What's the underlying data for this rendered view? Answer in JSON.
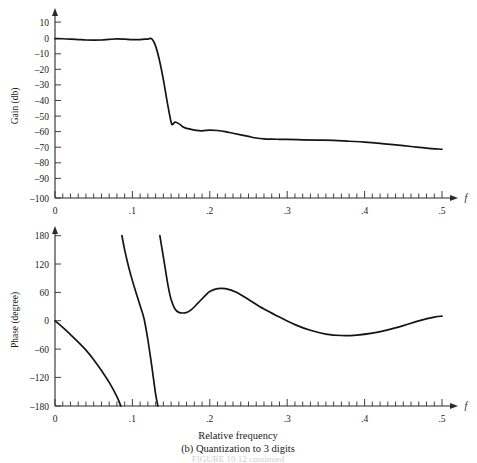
{
  "figure": {
    "caption_line1": "Relative frequency",
    "caption_line2": "(b) Quantization to 3 digits",
    "caption_faint": "FIGURE 10.12   continued"
  },
  "chart_data": [
    {
      "type": "line",
      "title": "",
      "panel": "gain",
      "xlabel": "f",
      "ylabel": "Gain (db)",
      "xlim": [
        0,
        0.5
      ],
      "ylim": [
        -100,
        10
      ],
      "yticks": [
        10,
        0,
        -10,
        -20,
        -30,
        -40,
        -50,
        -60,
        -70,
        -80,
        -90,
        -100
      ],
      "ytick_labels": [
        "10",
        "0",
        "–10",
        "–20",
        "–30",
        "–40",
        "–50",
        "–60",
        "–70",
        "–80",
        "–90",
        "–100"
      ],
      "xticks": [
        0,
        0.1,
        0.2,
        0.3,
        0.4,
        0.5
      ],
      "xtick_labels": [
        "0",
        ".1",
        ".2",
        ".3",
        ".4",
        ".5"
      ],
      "minor_tick_step": 0.01,
      "grid": false,
      "legend": "none",
      "x": [
        0.0,
        0.01,
        0.02,
        0.03,
        0.04,
        0.05,
        0.06,
        0.07,
        0.08,
        0.09,
        0.1,
        0.11,
        0.12,
        0.125,
        0.13,
        0.135,
        0.14,
        0.145,
        0.15,
        0.152,
        0.155,
        0.16,
        0.165,
        0.17,
        0.18,
        0.19,
        0.2,
        0.21,
        0.22,
        0.23,
        0.24,
        0.25,
        0.26,
        0.27,
        0.28,
        0.29,
        0.3,
        0.32,
        0.34,
        0.36,
        0.38,
        0.4,
        0.42,
        0.44,
        0.46,
        0.48,
        0.5
      ],
      "y": [
        -0.3,
        -0.4,
        -0.6,
        -0.9,
        -1.2,
        -1.3,
        -1.2,
        -0.8,
        -0.5,
        -0.7,
        -1.0,
        -0.9,
        -0.6,
        -0.5,
        -5.0,
        -14.0,
        -26.0,
        -40.0,
        -52.5,
        -54.0,
        -52.5,
        -53.5,
        -55.5,
        -56.5,
        -57.5,
        -58.0,
        -57.5,
        -57.8,
        -58.5,
        -59.5,
        -60.5,
        -61.5,
        -62.5,
        -63.0,
        -63.2,
        -63.3,
        -63.4,
        -63.6,
        -63.8,
        -64.0,
        -64.5,
        -65.0,
        -65.8,
        -66.8,
        -67.8,
        -68.8,
        -69.5
      ]
    },
    {
      "type": "line",
      "title": "",
      "panel": "phase",
      "xlabel": "f",
      "ylabel": "Phase (degree)",
      "xlim": [
        0,
        0.5
      ],
      "ylim": [
        -180,
        180
      ],
      "yticks": [
        180,
        120,
        60,
        0,
        -60,
        -120,
        -180
      ],
      "ytick_labels": [
        "180",
        "120",
        "60",
        "0",
        "–60",
        "–120",
        "–180"
      ],
      "xticks": [
        0,
        0.1,
        0.2,
        0.3,
        0.4,
        0.5
      ],
      "xtick_labels": [
        "0",
        ".1",
        ".2",
        ".3",
        ".4",
        ".5"
      ],
      "minor_tick_step": 0.01,
      "grid": false,
      "legend": "none",
      "branches": [
        {
          "name": "branch-1",
          "x": [
            0.0,
            0.01,
            0.02,
            0.03,
            0.04,
            0.05,
            0.06,
            0.07,
            0.08,
            0.085
          ],
          "y": [
            0,
            -14,
            -29,
            -45,
            -62,
            -82,
            -105,
            -130,
            -160,
            -180
          ]
        },
        {
          "name": "branch-2",
          "x": [
            0.0865,
            0.09,
            0.095,
            0.1,
            0.105,
            0.11,
            0.115,
            0.12,
            0.125,
            0.13,
            0.133
          ],
          "y": [
            180,
            150,
            115,
            85,
            58,
            32,
            5,
            -40,
            -95,
            -155,
            -180
          ]
        },
        {
          "name": "branch-3",
          "x": [
            0.1355,
            0.138,
            0.142,
            0.146,
            0.15,
            0.155,
            0.16,
            0.168,
            0.175,
            0.185,
            0.195,
            0.2,
            0.21,
            0.22,
            0.235,
            0.25,
            0.27,
            0.29,
            0.31,
            0.33,
            0.35,
            0.37,
            0.39,
            0.41,
            0.43,
            0.45,
            0.47,
            0.49,
            0.5
          ],
          "y": [
            180,
            155,
            115,
            75,
            45,
            25,
            18,
            17,
            22,
            38,
            55,
            62,
            68,
            68,
            60,
            45,
            25,
            8,
            -8,
            -20,
            -28,
            -31,
            -30,
            -26,
            -19,
            -10,
            0,
            8,
            10
          ]
        }
      ]
    }
  ]
}
